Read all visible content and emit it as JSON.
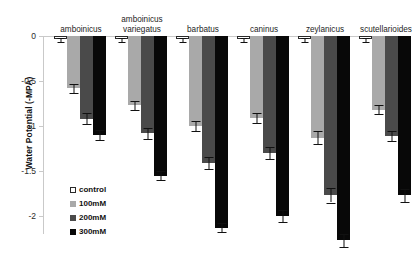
{
  "chart_data": {
    "type": "bar",
    "title": "",
    "xlabel": "",
    "ylabel": "Water Potential (-MPA)",
    "ylim": [
      -2.4,
      0
    ],
    "yticks": [
      "0",
      "-0.5",
      "-1",
      "-1.5",
      "-2"
    ],
    "ytick_values": [
      0,
      -0.5,
      -1,
      -1.5,
      -2
    ],
    "grid": false,
    "legend_position": "inside-left",
    "categories": [
      "amboinicus",
      "amboinicus variegatus",
      "barbatus",
      "caninus",
      "zeylanicus",
      "scutellarioides"
    ],
    "series": [
      {
        "name": "control",
        "color": "#ffffff",
        "values": [
          -0.03,
          -0.03,
          -0.03,
          -0.03,
          -0.03,
          -0.03
        ],
        "errors": [
          0.02,
          0.02,
          0.02,
          0.02,
          0.02,
          0.02
        ]
      },
      {
        "name": "100mM",
        "color": "#a9a9a9",
        "values": [
          -0.58,
          -0.77,
          -1.0,
          -0.91,
          -1.13,
          -0.82
        ],
        "errors": [
          0.05,
          0.05,
          0.06,
          0.06,
          0.07,
          0.05
        ]
      },
      {
        "name": "200mM",
        "color": "#4a4a4a",
        "values": [
          -0.92,
          -1.08,
          -1.41,
          -1.3,
          -1.77,
          -1.11
        ],
        "errors": [
          0.06,
          0.06,
          0.07,
          0.07,
          0.08,
          0.06
        ]
      },
      {
        "name": "300mM",
        "color": "#080808",
        "values": [
          -1.1,
          -1.55,
          -2.13,
          -2.0,
          -2.27,
          -1.77
        ],
        "errors": [
          0.06,
          0.05,
          0.05,
          0.07,
          0.07,
          0.07
        ]
      }
    ]
  },
  "legend": {
    "items": [
      {
        "label": "control",
        "swatch": "control"
      },
      {
        "label": "100mM",
        "swatch": "c100"
      },
      {
        "label": "200mM",
        "swatch": "c200"
      },
      {
        "label": "300mM",
        "swatch": "c300"
      }
    ]
  },
  "axis": {
    "y_title": "Water Potential (-MPA)"
  }
}
